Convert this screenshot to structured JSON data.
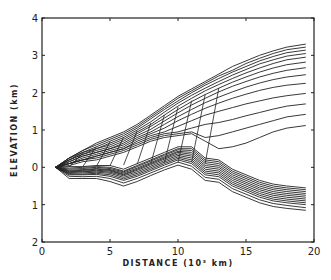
{
  "chart_data": {
    "type": "line",
    "title": "",
    "xlabel": "DISTANCE (10³ km)",
    "ylabel": "ELEVATION (km)",
    "xlim": [
      0,
      20
    ],
    "ylim": [
      -2,
      4
    ],
    "x_ticks": [
      "0",
      "5",
      "10",
      "15",
      "20"
    ],
    "y_ticks": [
      "2",
      "1",
      "0",
      "1",
      "2",
      "3",
      "4"
    ],
    "y_tick_values": [
      -2,
      -1,
      0,
      1,
      2,
      3,
      4
    ],
    "grid": false,
    "legend": null,
    "x": [
      1,
      2,
      3,
      4,
      5,
      6,
      7,
      8,
      9,
      10,
      11,
      12,
      13,
      14,
      15,
      16,
      17,
      18,
      19.4
    ],
    "series_upper": [
      {
        "name": "u1",
        "values": [
          0,
          0.25,
          0.45,
          0.65,
          0.8,
          0.95,
          1.15,
          1.4,
          1.65,
          1.9,
          2.1,
          2.3,
          2.5,
          2.7,
          2.85,
          3.0,
          3.12,
          3.22,
          3.3
        ]
      },
      {
        "name": "u2",
        "values": [
          0,
          0.25,
          0.45,
          0.6,
          0.75,
          0.9,
          1.1,
          1.35,
          1.6,
          1.85,
          2.05,
          2.25,
          2.45,
          2.6,
          2.78,
          2.92,
          3.05,
          3.15,
          3.22
        ]
      },
      {
        "name": "u3",
        "values": [
          0,
          0.25,
          0.4,
          0.55,
          0.7,
          0.85,
          1.05,
          1.3,
          1.55,
          1.78,
          2.0,
          2.2,
          2.38,
          2.55,
          2.7,
          2.85,
          2.97,
          3.07,
          3.14
        ]
      },
      {
        "name": "u4",
        "values": [
          0,
          0.2,
          0.4,
          0.5,
          0.65,
          0.8,
          1.0,
          1.22,
          1.48,
          1.72,
          1.93,
          2.12,
          2.3,
          2.47,
          2.62,
          2.77,
          2.88,
          2.98,
          3.05
        ]
      },
      {
        "name": "u5",
        "values": [
          0,
          0.2,
          0.35,
          0.5,
          0.6,
          0.75,
          0.95,
          1.15,
          1.4,
          1.64,
          1.85,
          2.05,
          2.22,
          2.38,
          2.53,
          2.66,
          2.78,
          2.88,
          2.95
        ]
      },
      {
        "name": "u6",
        "values": [
          0,
          0.2,
          0.35,
          0.45,
          0.55,
          0.7,
          0.9,
          1.1,
          1.32,
          1.55,
          1.76,
          1.95,
          2.12,
          2.28,
          2.42,
          2.55,
          2.66,
          2.75,
          2.82
        ]
      },
      {
        "name": "u7",
        "values": [
          0,
          0.15,
          0.3,
          0.4,
          0.5,
          0.65,
          0.85,
          1.02,
          1.24,
          1.46,
          1.67,
          1.85,
          2.02,
          2.17,
          2.3,
          2.42,
          2.52,
          2.6,
          2.67
        ]
      },
      {
        "name": "u8",
        "values": [
          0,
          0.15,
          0.3,
          0.4,
          0.5,
          0.6,
          0.8,
          0.95,
          1.15,
          1.36,
          1.55,
          1.73,
          1.88,
          2.02,
          2.15,
          2.26,
          2.35,
          2.42,
          2.48
        ]
      },
      {
        "name": "u9",
        "values": [
          0,
          0.1,
          0.25,
          0.35,
          0.45,
          0.55,
          0.75,
          0.9,
          1.05,
          1.25,
          1.42,
          1.58,
          1.72,
          1.85,
          1.96,
          2.06,
          2.14,
          2.2,
          2.25
        ]
      },
      {
        "name": "u10",
        "values": [
          0,
          0.1,
          0.2,
          0.3,
          0.4,
          0.5,
          0.7,
          0.85,
          0.95,
          1.1,
          1.25,
          1.4,
          1.5,
          1.6,
          1.7,
          1.78,
          1.86,
          1.92,
          1.98
        ]
      },
      {
        "name": "u11",
        "values": [
          0,
          0.1,
          0.2,
          0.3,
          0.4,
          0.5,
          0.65,
          0.8,
          0.9,
          0.95,
          1.05,
          1.15,
          1.2,
          1.28,
          1.38,
          1.47,
          1.56,
          1.64,
          1.7
        ]
      },
      {
        "name": "u12",
        "values": [
          0,
          0.1,
          0.2,
          0.25,
          0.35,
          0.45,
          0.6,
          0.75,
          0.85,
          0.9,
          0.95,
          0.8,
          0.85,
          0.95,
          1.05,
          1.15,
          1.25,
          1.35,
          1.42
        ]
      },
      {
        "name": "u13",
        "values": [
          0,
          0.05,
          0.15,
          0.2,
          0.3,
          0.4,
          0.55,
          0.7,
          0.8,
          0.85,
          0.9,
          0.7,
          0.5,
          0.55,
          0.65,
          0.8,
          0.95,
          1.05,
          1.12
        ]
      }
    ],
    "series_lower": [
      {
        "name": "l1",
        "values": [
          0,
          0.02,
          0.02,
          0.05,
          0.05,
          -0.05,
          0.1,
          0.25,
          0.4,
          0.55,
          0.55,
          0.25,
          0.2,
          -0.05,
          -0.2,
          -0.35,
          -0.45,
          -0.5,
          -0.55
        ]
      },
      {
        "name": "l2",
        "values": [
          0,
          -0.02,
          0.0,
          0.02,
          0.0,
          -0.1,
          0.05,
          0.2,
          0.35,
          0.5,
          0.5,
          0.2,
          0.15,
          -0.1,
          -0.25,
          -0.4,
          -0.5,
          -0.55,
          -0.6
        ]
      },
      {
        "name": "l3",
        "values": [
          0,
          -0.05,
          -0.03,
          0.0,
          -0.03,
          -0.12,
          0.02,
          0.17,
          0.32,
          0.47,
          0.45,
          0.15,
          0.1,
          -0.15,
          -0.3,
          -0.45,
          -0.55,
          -0.6,
          -0.65
        ]
      },
      {
        "name": "l4",
        "values": [
          0,
          -0.08,
          -0.06,
          -0.03,
          -0.06,
          -0.15,
          -0.02,
          0.13,
          0.28,
          0.43,
          0.4,
          0.1,
          0.05,
          -0.2,
          -0.35,
          -0.5,
          -0.6,
          -0.65,
          -0.7
        ]
      },
      {
        "name": "l5",
        "values": [
          0,
          -0.1,
          -0.08,
          -0.05,
          -0.08,
          -0.18,
          -0.05,
          0.1,
          0.25,
          0.4,
          0.35,
          0.05,
          0.0,
          -0.25,
          -0.4,
          -0.55,
          -0.65,
          -0.7,
          -0.75
        ]
      },
      {
        "name": "l6",
        "values": [
          0,
          -0.12,
          -0.1,
          -0.08,
          -0.1,
          -0.2,
          -0.08,
          0.07,
          0.22,
          0.36,
          0.3,
          0.0,
          -0.05,
          -0.3,
          -0.45,
          -0.6,
          -0.7,
          -0.75,
          -0.8
        ]
      },
      {
        "name": "l7",
        "values": [
          0,
          -0.14,
          -0.12,
          -0.1,
          -0.13,
          -0.23,
          -0.12,
          0.03,
          0.18,
          0.32,
          0.25,
          -0.05,
          -0.1,
          -0.35,
          -0.5,
          -0.65,
          -0.75,
          -0.8,
          -0.85
        ]
      },
      {
        "name": "l8",
        "values": [
          0,
          -0.16,
          -0.15,
          -0.13,
          -0.16,
          -0.27,
          -0.16,
          -0.01,
          0.14,
          0.28,
          0.2,
          -0.1,
          -0.15,
          -0.4,
          -0.55,
          -0.7,
          -0.8,
          -0.85,
          -0.9
        ]
      },
      {
        "name": "l9",
        "values": [
          0,
          -0.18,
          -0.18,
          -0.16,
          -0.2,
          -0.31,
          -0.2,
          -0.05,
          0.1,
          0.24,
          0.15,
          -0.15,
          -0.2,
          -0.45,
          -0.6,
          -0.75,
          -0.85,
          -0.9,
          -0.95
        ]
      },
      {
        "name": "l10",
        "values": [
          0,
          -0.2,
          -0.2,
          -0.19,
          -0.24,
          -0.35,
          -0.24,
          -0.09,
          0.06,
          0.2,
          0.1,
          -0.2,
          -0.25,
          -0.5,
          -0.65,
          -0.8,
          -0.9,
          -0.95,
          -1.0
        ]
      },
      {
        "name": "l11",
        "values": [
          0,
          -0.24,
          -0.25,
          -0.24,
          -0.3,
          -0.42,
          -0.3,
          -0.15,
          0.0,
          0.14,
          0.03,
          -0.27,
          -0.32,
          -0.57,
          -0.72,
          -0.87,
          -0.97,
          -1.02,
          -1.08
        ]
      },
      {
        "name": "l12",
        "values": [
          0,
          -0.3,
          -0.3,
          -0.3,
          -0.38,
          -0.5,
          -0.38,
          -0.22,
          -0.07,
          0.06,
          -0.05,
          -0.35,
          -0.4,
          -0.65,
          -0.8,
          -0.95,
          -1.05,
          -1.1,
          -1.15
        ]
      }
    ]
  }
}
